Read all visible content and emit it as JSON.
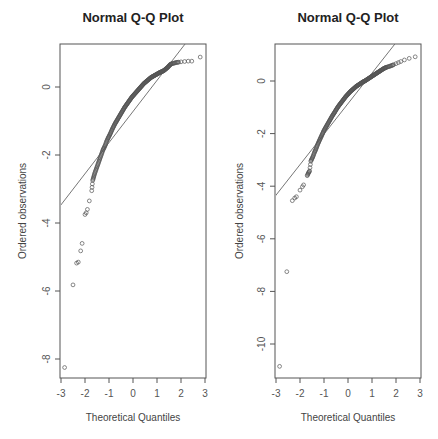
{
  "chart_data": [
    {
      "type": "scatter",
      "title": "Normal Q-Q Plot",
      "xlabel": "Theoretical Quantiles",
      "ylabel": "Ordered observations",
      "xlim": [
        -3.1,
        3.1
      ],
      "ylim": [
        -8.6,
        1.3
      ],
      "xticks": [
        -3,
        -2,
        -1,
        0,
        1,
        2,
        3
      ],
      "yticks": [
        0,
        -2,
        -4,
        -6,
        -8
      ],
      "grid": false,
      "reference_line": {
        "slope": 0.915,
        "intercept": -0.72
      },
      "layout": {
        "left": 61,
        "right": 205,
        "top": 44,
        "bottom": 378,
        "x0px": 61,
        "xscale": 24,
        "y0px": 87,
        "yscale": 34
      },
      "points_summary": "Roughly 250 sample quantiles; long left tail",
      "points": [
        [
          -2.85,
          -8.25
        ],
        [
          -2.5,
          -5.82
        ],
        [
          -2.35,
          -5.18
        ],
        [
          -2.28,
          -5.15
        ],
        [
          -2.18,
          -4.82
        ],
        [
          -2.12,
          -4.6
        ],
        [
          -2.0,
          -3.75
        ],
        [
          -1.95,
          -3.7
        ],
        [
          -1.9,
          -3.6
        ],
        [
          -1.82,
          -3.35
        ],
        [
          -1.72,
          -3.05
        ],
        [
          -1.68,
          -2.75
        ],
        [
          -1.64,
          -2.65
        ],
        [
          -1.6,
          -2.55
        ],
        [
          -1.55,
          -2.45
        ],
        [
          -1.5,
          -2.35
        ],
        [
          -1.45,
          -2.25
        ],
        [
          -1.4,
          -2.15
        ],
        [
          -1.35,
          -2.05
        ],
        [
          -1.3,
          -1.95
        ],
        [
          -1.25,
          -1.85
        ],
        [
          -1.2,
          -1.78
        ],
        [
          -1.15,
          -1.7
        ],
        [
          -1.1,
          -1.6
        ],
        [
          -1.05,
          -1.52
        ],
        [
          -1.0,
          -1.45
        ],
        [
          -0.95,
          -1.38
        ],
        [
          -0.9,
          -1.3
        ],
        [
          -0.85,
          -1.22
        ],
        [
          -0.8,
          -1.15
        ],
        [
          -0.75,
          -1.08
        ],
        [
          -0.7,
          -1.02
        ],
        [
          -0.65,
          -0.96
        ],
        [
          -0.6,
          -0.9
        ],
        [
          -0.55,
          -0.84
        ],
        [
          -0.5,
          -0.78
        ],
        [
          -0.45,
          -0.72
        ],
        [
          -0.4,
          -0.66
        ],
        [
          -0.35,
          -0.6
        ],
        [
          -0.3,
          -0.55
        ],
        [
          -0.25,
          -0.5
        ],
        [
          -0.2,
          -0.45
        ],
        [
          -0.15,
          -0.4
        ],
        [
          -0.1,
          -0.35
        ],
        [
          -0.05,
          -0.3
        ],
        [
          0.0,
          -0.26
        ],
        [
          0.05,
          -0.22
        ],
        [
          0.1,
          -0.18
        ],
        [
          0.15,
          -0.14
        ],
        [
          0.2,
          -0.1
        ],
        [
          0.25,
          -0.06
        ],
        [
          0.3,
          -0.02
        ],
        [
          0.35,
          0.02
        ],
        [
          0.4,
          0.06
        ],
        [
          0.45,
          0.1
        ],
        [
          0.5,
          0.13
        ],
        [
          0.55,
          0.16
        ],
        [
          0.6,
          0.19
        ],
        [
          0.65,
          0.22
        ],
        [
          0.7,
          0.25
        ],
        [
          0.75,
          0.28
        ],
        [
          0.8,
          0.3
        ],
        [
          0.85,
          0.32
        ],
        [
          0.9,
          0.34
        ],
        [
          0.95,
          0.36
        ],
        [
          1.0,
          0.38
        ],
        [
          1.05,
          0.4
        ],
        [
          1.1,
          0.42
        ],
        [
          1.15,
          0.44
        ],
        [
          1.2,
          0.45
        ],
        [
          1.25,
          0.47
        ],
        [
          1.3,
          0.49
        ],
        [
          1.35,
          0.52
        ],
        [
          1.4,
          0.55
        ],
        [
          1.45,
          0.58
        ],
        [
          1.5,
          0.62
        ],
        [
          1.55,
          0.66
        ],
        [
          1.6,
          0.68
        ],
        [
          1.7,
          0.7
        ],
        [
          1.8,
          0.72
        ],
        [
          1.9,
          0.73
        ],
        [
          2.0,
          0.74
        ],
        [
          2.15,
          0.75
        ],
        [
          2.3,
          0.76
        ],
        [
          2.45,
          0.76
        ],
        [
          2.8,
          0.88
        ]
      ]
    },
    {
      "type": "scatter",
      "title": "Normal Q-Q Plot",
      "xlabel": "Theoretical Quantiles",
      "ylabel": "Ordered observations",
      "xlim": [
        -3.1,
        3.1
      ],
      "ylim": [
        -11.4,
        1.4
      ],
      "xticks": [
        -3,
        -2,
        -1,
        0,
        1,
        2,
        3
      ],
      "yticks": [
        0,
        -2,
        -4,
        -6,
        -8,
        -10
      ],
      "grid": false,
      "reference_line": {
        "slope": 1.16,
        "intercept": -0.86
      },
      "layout": {
        "left": 276,
        "right": 420,
        "top": 44,
        "bottom": 378,
        "x0px": 276,
        "xscale": 24,
        "y0px": 81,
        "yscale": 26.3
      },
      "points_summary": "Roughly 250 sample quantiles; long left tail",
      "points": [
        [
          -2.85,
          -10.85
        ],
        [
          -2.55,
          -7.25
        ],
        [
          -2.32,
          -4.55
        ],
        [
          -2.22,
          -4.45
        ],
        [
          -2.15,
          -4.4
        ],
        [
          -2.0,
          -4.15
        ],
        [
          -1.9,
          -4.02
        ],
        [
          -1.85,
          -3.95
        ],
        [
          -1.7,
          -3.6
        ],
        [
          -1.65,
          -3.5
        ],
        [
          -1.6,
          -3.42
        ],
        [
          -1.55,
          -3.05
        ],
        [
          -1.5,
          -2.95
        ],
        [
          -1.45,
          -2.85
        ],
        [
          -1.4,
          -2.72
        ],
        [
          -1.35,
          -2.62
        ],
        [
          -1.3,
          -2.5
        ],
        [
          -1.25,
          -2.38
        ],
        [
          -1.2,
          -2.28
        ],
        [
          -1.15,
          -2.18
        ],
        [
          -1.1,
          -2.08
        ],
        [
          -1.05,
          -1.98
        ],
        [
          -1.0,
          -1.88
        ],
        [
          -0.95,
          -1.8
        ],
        [
          -0.9,
          -1.72
        ],
        [
          -0.85,
          -1.64
        ],
        [
          -0.8,
          -1.56
        ],
        [
          -0.75,
          -1.48
        ],
        [
          -0.7,
          -1.4
        ],
        [
          -0.65,
          -1.32
        ],
        [
          -0.6,
          -1.25
        ],
        [
          -0.55,
          -1.18
        ],
        [
          -0.5,
          -1.1
        ],
        [
          -0.45,
          -1.03
        ],
        [
          -0.4,
          -0.96
        ],
        [
          -0.35,
          -0.9
        ],
        [
          -0.3,
          -0.84
        ],
        [
          -0.25,
          -0.78
        ],
        [
          -0.2,
          -0.72
        ],
        [
          -0.15,
          -0.66
        ],
        [
          -0.1,
          -0.6
        ],
        [
          -0.05,
          -0.55
        ],
        [
          0.0,
          -0.5
        ],
        [
          0.05,
          -0.45
        ],
        [
          0.1,
          -0.4
        ],
        [
          0.15,
          -0.36
        ],
        [
          0.2,
          -0.32
        ],
        [
          0.25,
          -0.28
        ],
        [
          0.3,
          -0.24
        ],
        [
          0.35,
          -0.2
        ],
        [
          0.4,
          -0.17
        ],
        [
          0.45,
          -0.14
        ],
        [
          0.5,
          -0.11
        ],
        [
          0.55,
          -0.08
        ],
        [
          0.6,
          -0.05
        ],
        [
          0.65,
          -0.02
        ],
        [
          0.7,
          0.0
        ],
        [
          0.75,
          0.03
        ],
        [
          0.8,
          0.06
        ],
        [
          0.85,
          0.09
        ],
        [
          0.9,
          0.12
        ],
        [
          0.95,
          0.15
        ],
        [
          1.0,
          0.18
        ],
        [
          1.05,
          0.21
        ],
        [
          1.1,
          0.24
        ],
        [
          1.15,
          0.27
        ],
        [
          1.2,
          0.3
        ],
        [
          1.25,
          0.33
        ],
        [
          1.3,
          0.36
        ],
        [
          1.35,
          0.39
        ],
        [
          1.4,
          0.42
        ],
        [
          1.45,
          0.45
        ],
        [
          1.5,
          0.48
        ],
        [
          1.55,
          0.5
        ],
        [
          1.6,
          0.52
        ],
        [
          1.7,
          0.55
        ],
        [
          1.8,
          0.58
        ],
        [
          1.9,
          0.62
        ],
        [
          2.0,
          0.66
        ],
        [
          2.1,
          0.7
        ],
        [
          2.2,
          0.74
        ],
        [
          2.35,
          0.8
        ],
        [
          2.55,
          0.86
        ],
        [
          2.8,
          0.92
        ]
      ]
    }
  ],
  "labels": {
    "left_title": "Normal Q-Q Plot",
    "right_title": "Normal Q-Q Plot",
    "left_xlabel": "Theoretical Quantiles",
    "right_xlabel": "Theoretical Quantiles",
    "left_ylabel": "Ordered observations",
    "right_ylabel": "Ordered observations"
  }
}
